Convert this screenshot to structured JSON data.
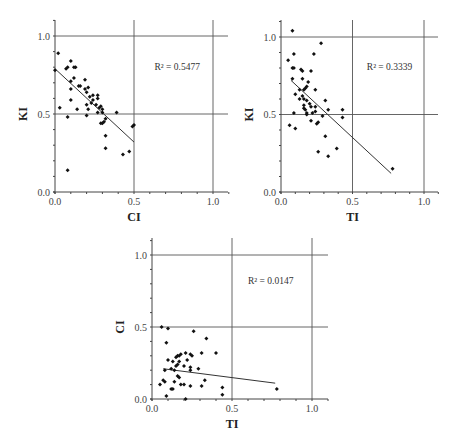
{
  "chart_data": [
    {
      "id": "ki-vs-ci",
      "type": "scatter",
      "xlabel": "CI",
      "ylabel": "KI",
      "xlim": [
        0,
        1.1
      ],
      "ylim": [
        0,
        1.1
      ],
      "xticks": [
        "0.0",
        "0.5",
        "1.0"
      ],
      "yticks": [
        "0.0",
        "0.5",
        "1.0"
      ],
      "grid": true,
      "annotation": "R² = 0.5477",
      "trendline": {
        "x": [
          0.0,
          0.5
        ],
        "y": [
          0.79,
          0.32
        ]
      },
      "points": [
        [
          0.02,
          0.89
        ],
        [
          0.0,
          0.78
        ],
        [
          0.03,
          0.54
        ],
        [
          0.07,
          0.79
        ],
        [
          0.08,
          0.8
        ],
        [
          0.1,
          0.84
        ],
        [
          0.12,
          0.8
        ],
        [
          0.13,
          0.8
        ],
        [
          0.12,
          0.73
        ],
        [
          0.1,
          0.71
        ],
        [
          0.1,
          0.66
        ],
        [
          0.1,
          0.59
        ],
        [
          0.08,
          0.48
        ],
        [
          0.14,
          0.53
        ],
        [
          0.15,
          0.68
        ],
        [
          0.16,
          0.68
        ],
        [
          0.19,
          0.72
        ],
        [
          0.19,
          0.66
        ],
        [
          0.2,
          0.64
        ],
        [
          0.21,
          0.67
        ],
        [
          0.2,
          0.56
        ],
        [
          0.22,
          0.61
        ],
        [
          0.23,
          0.57
        ],
        [
          0.21,
          0.53
        ],
        [
          0.2,
          0.49
        ],
        [
          0.24,
          0.62
        ],
        [
          0.24,
          0.59
        ],
        [
          0.26,
          0.56
        ],
        [
          0.27,
          0.6
        ],
        [
          0.27,
          0.62
        ],
        [
          0.28,
          0.54
        ],
        [
          0.29,
          0.55
        ],
        [
          0.3,
          0.53
        ],
        [
          0.3,
          0.51
        ],
        [
          0.27,
          0.51
        ],
        [
          0.29,
          0.44
        ],
        [
          0.3,
          0.44
        ],
        [
          0.31,
          0.45
        ],
        [
          0.32,
          0.47
        ],
        [
          0.32,
          0.36
        ],
        [
          0.32,
          0.28
        ],
        [
          0.39,
          0.51
        ],
        [
          0.43,
          0.24
        ],
        [
          0.47,
          0.26
        ],
        [
          0.49,
          0.42
        ],
        [
          0.5,
          0.43
        ],
        [
          0.08,
          0.14
        ]
      ]
    },
    {
      "id": "ki-vs-ti",
      "type": "scatter",
      "xlabel": "TI",
      "ylabel": "KI",
      "xlim": [
        0,
        1.1
      ],
      "ylim": [
        0,
        1.1
      ],
      "xticks": [
        "0.0",
        "0.5",
        "1.0"
      ],
      "yticks": [
        "0.0",
        "0.5",
        "1.0"
      ],
      "grid": true,
      "annotation": "R² = 0.3339",
      "trendline": {
        "x": [
          0.07,
          0.77
        ],
        "y": [
          0.72,
          0.12
        ]
      },
      "points": [
        [
          0.08,
          1.04
        ],
        [
          0.05,
          0.85
        ],
        [
          0.09,
          0.89
        ],
        [
          0.28,
          0.96
        ],
        [
          0.23,
          0.89
        ],
        [
          0.08,
          0.8
        ],
        [
          0.09,
          0.8
        ],
        [
          0.14,
          0.79
        ],
        [
          0.15,
          0.78
        ],
        [
          0.21,
          0.78
        ],
        [
          0.08,
          0.73
        ],
        [
          0.15,
          0.73
        ],
        [
          0.19,
          0.71
        ],
        [
          0.1,
          0.63
        ],
        [
          0.13,
          0.66
        ],
        [
          0.16,
          0.66
        ],
        [
          0.17,
          0.67
        ],
        [
          0.18,
          0.68
        ],
        [
          0.24,
          0.66
        ],
        [
          0.13,
          0.6
        ],
        [
          0.15,
          0.62
        ],
        [
          0.16,
          0.6
        ],
        [
          0.18,
          0.59
        ],
        [
          0.16,
          0.54
        ],
        [
          0.16,
          0.56
        ],
        [
          0.17,
          0.53
        ],
        [
          0.18,
          0.51
        ],
        [
          0.2,
          0.57
        ],
        [
          0.21,
          0.55
        ],
        [
          0.22,
          0.51
        ],
        [
          0.24,
          0.55
        ],
        [
          0.24,
          0.52
        ],
        [
          0.18,
          0.5
        ],
        [
          0.09,
          0.51
        ],
        [
          0.06,
          0.43
        ],
        [
          0.1,
          0.41
        ],
        [
          0.21,
          0.46
        ],
        [
          0.25,
          0.44
        ],
        [
          0.26,
          0.45
        ],
        [
          0.29,
          0.49
        ],
        [
          0.31,
          0.59
        ],
        [
          0.33,
          0.53
        ],
        [
          0.43,
          0.53
        ],
        [
          0.43,
          0.48
        ],
        [
          0.31,
          0.36
        ],
        [
          0.39,
          0.28
        ],
        [
          0.26,
          0.26
        ],
        [
          0.33,
          0.23
        ],
        [
          0.78,
          0.15
        ]
      ]
    },
    {
      "id": "ci-vs-ti",
      "type": "scatter",
      "xlabel": "TI",
      "ylabel": "CI",
      "xlim": [
        0,
        1.1
      ],
      "ylim": [
        0,
        1.1
      ],
      "xticks": [
        "0.0",
        "0.5",
        "1.0"
      ],
      "yticks": [
        "0.0",
        "0.5",
        "1.0"
      ],
      "grid": true,
      "annotation": "R² = 0.0147",
      "trendline": {
        "x": [
          0.07,
          0.77
        ],
        "y": [
          0.21,
          0.11
        ]
      },
      "points": [
        [
          0.06,
          0.5
        ],
        [
          0.1,
          0.49
        ],
        [
          0.09,
          0.39
        ],
        [
          0.26,
          0.47
        ],
        [
          0.34,
          0.42
        ],
        [
          0.1,
          0.27
        ],
        [
          0.13,
          0.26
        ],
        [
          0.15,
          0.29
        ],
        [
          0.16,
          0.3
        ],
        [
          0.17,
          0.3
        ],
        [
          0.18,
          0.31
        ],
        [
          0.21,
          0.32
        ],
        [
          0.22,
          0.27
        ],
        [
          0.24,
          0.31
        ],
        [
          0.25,
          0.3
        ],
        [
          0.31,
          0.32
        ],
        [
          0.4,
          0.32
        ],
        [
          0.12,
          0.21
        ],
        [
          0.14,
          0.2
        ],
        [
          0.15,
          0.23
        ],
        [
          0.16,
          0.24
        ],
        [
          0.17,
          0.26
        ],
        [
          0.2,
          0.23
        ],
        [
          0.24,
          0.22
        ],
        [
          0.24,
          0.2
        ],
        [
          0.29,
          0.21
        ],
        [
          0.08,
          0.2
        ],
        [
          0.05,
          0.1
        ],
        [
          0.07,
          0.13
        ],
        [
          0.08,
          0.12
        ],
        [
          0.12,
          0.07
        ],
        [
          0.13,
          0.07
        ],
        [
          0.14,
          0.12
        ],
        [
          0.16,
          0.16
        ],
        [
          0.17,
          0.15
        ],
        [
          0.18,
          0.1
        ],
        [
          0.2,
          0.1
        ],
        [
          0.24,
          0.09
        ],
        [
          0.31,
          0.09
        ],
        [
          0.33,
          0.13
        ],
        [
          0.44,
          0.08
        ],
        [
          0.44,
          0.03
        ],
        [
          0.09,
          0.02
        ],
        [
          0.21,
          0.0
        ],
        [
          0.78,
          0.07
        ]
      ]
    }
  ],
  "layout": {
    "charts": [
      {
        "x0": 55,
        "x1": 213,
        "y0": 192,
        "y1": 36,
        "right": 228,
        "top": 20
      },
      {
        "x0": 281,
        "x1": 424,
        "y0": 192,
        "y1": 37,
        "right": 438,
        "top": 20
      },
      {
        "x0": 152,
        "x1": 312,
        "y0": 399,
        "y1": 255,
        "right": 328,
        "top": 238
      }
    ],
    "annotation_pos": [
      [
        0.63,
        0.78
      ],
      [
        0.6,
        0.79
      ],
      [
        0.6,
        0.8
      ]
    ]
  }
}
